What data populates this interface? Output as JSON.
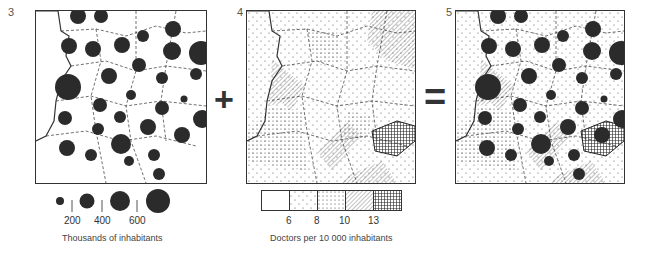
{
  "panels": [
    {
      "number": "3",
      "title": "Population map"
    },
    {
      "number": "4",
      "title": "Doctors density map"
    },
    {
      "number": "5",
      "title": "Combined map"
    }
  ],
  "operators": {
    "plus": "+",
    "equals": "="
  },
  "legend_population": {
    "ticks": [
      "200",
      "400",
      "600"
    ],
    "caption": "Thousands of inhabitants"
  },
  "legend_doctors": {
    "ticks": [
      "6",
      "8",
      "10",
      "13"
    ],
    "caption": "Doctors per 10 000 inhabitants"
  },
  "colors": {
    "ink": "#333333",
    "circle": "#2b2b2b",
    "background": "#ffffff"
  }
}
